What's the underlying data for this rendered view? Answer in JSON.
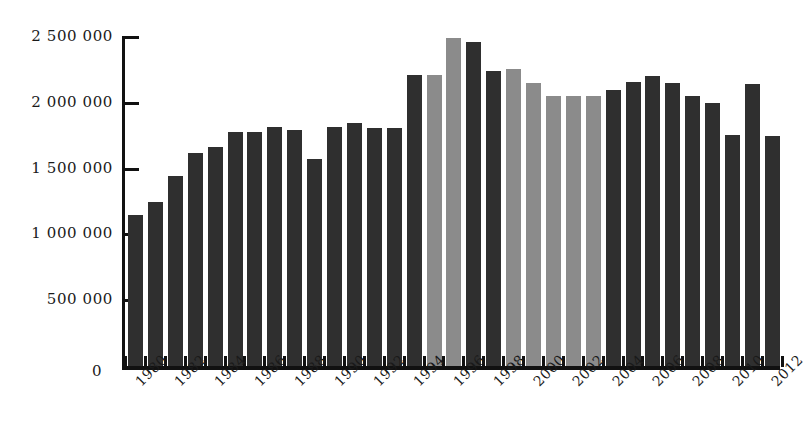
{
  "chart_data": {
    "type": "bar",
    "title": "",
    "subtitle": "",
    "xlabel": "",
    "ylabel": "",
    "grid": false,
    "legend": "none",
    "ylim": [
      0,
      2500000
    ],
    "ytick_values": [
      0,
      500000,
      1000000,
      1500000,
      2000000,
      2500000
    ],
    "ytick_labels": [
      "0",
      "500 000",
      "1 000 000",
      "1 500 000",
      "2 000 000",
      "2 500 000"
    ],
    "xtick_labels": [
      "1980",
      "1982",
      "1984",
      "1986",
      "1988",
      "1990",
      "1992",
      "1994",
      "1996",
      "1998",
      "2000",
      "2002",
      "2004",
      "2006",
      "2008",
      "2010",
      "2012"
    ],
    "xtick_label_rotation": -45,
    "categories": [
      "1980",
      "1981",
      "1982",
      "1983",
      "1984",
      "1985",
      "1986",
      "1987",
      "1988",
      "1989",
      "1990",
      "1991",
      "1992",
      "1993",
      "1994",
      "1995",
      "1996",
      "1997",
      "1998",
      "1999",
      "2000",
      "2001",
      "2002",
      "2003",
      "2004",
      "2005",
      "2006",
      "2007",
      "2008",
      "2009",
      "2010",
      "2011",
      "2012"
    ],
    "values": [
      1150000,
      1250000,
      1440000,
      1615000,
      1665000,
      1775000,
      1780000,
      1815000,
      1790000,
      1570000,
      1815000,
      1845000,
      1810000,
      1810000,
      2215000,
      2215000,
      2490000,
      2460000,
      2245000,
      2255000,
      2150000,
      2050000,
      2050000,
      2050000,
      2100000,
      2160000,
      2200000,
      2150000,
      2050000,
      2000000,
      1755000,
      2145000,
      1750000
    ],
    "bar_colors": [
      "dark",
      "dark",
      "dark",
      "dark",
      "dark",
      "dark",
      "dark",
      "dark",
      "dark",
      "dark",
      "dark",
      "dark",
      "dark",
      "dark",
      "dark",
      "gray",
      "gray",
      "dark",
      "dark",
      "gray",
      "gray",
      "gray",
      "gray",
      "gray",
      "dark",
      "dark",
      "dark",
      "dark",
      "dark",
      "dark",
      "dark",
      "dark",
      "dark"
    ],
    "colors": {
      "dark": "#2f2f2f",
      "gray": "#8b8b8b",
      "axis": "#111111",
      "background": "#ffffff"
    }
  }
}
